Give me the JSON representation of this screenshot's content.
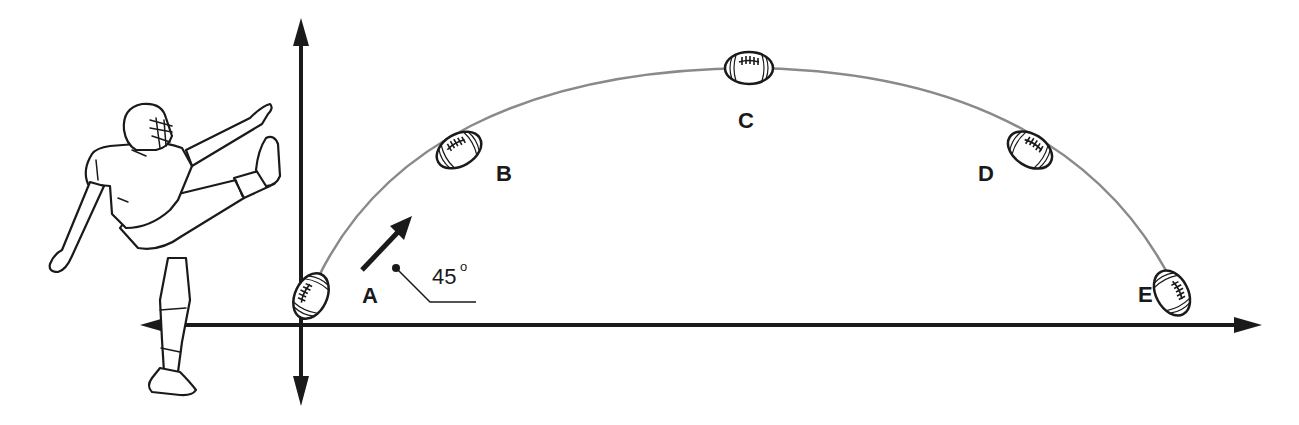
{
  "diagram": {
    "positions": [
      {
        "id": "A",
        "label": "A"
      },
      {
        "id": "B",
        "label": "B"
      },
      {
        "id": "C",
        "label": "C"
      },
      {
        "id": "D",
        "label": "D"
      },
      {
        "id": "E",
        "label": "E"
      }
    ],
    "launch_angle": {
      "value": "45",
      "unit": "°",
      "text": "45°"
    },
    "axes": {
      "horizontal": "bidirectional-arrow",
      "vertical": "bidirectional-arrow"
    },
    "figure": "football-kicker",
    "colors": {
      "ink": "#1a1a1a",
      "trajectory": "#8a8a8a",
      "background": "#ffffff"
    }
  }
}
